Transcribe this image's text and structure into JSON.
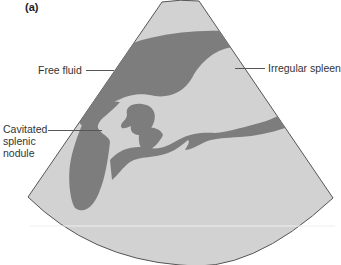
{
  "figure": {
    "panel_label": "(a)",
    "type": "ultrasound-schematic",
    "colors": {
      "background": "#ffffff",
      "parenchyma": "#d2d2d2",
      "dark_region": "#7d7d7d",
      "outline": "#555555"
    },
    "annotations": [
      {
        "id": "free-fluid",
        "text": "Free fluid"
      },
      {
        "id": "irregular-spleen",
        "text": "Irregular spleen"
      },
      {
        "id": "cavitated-splenic-nodule",
        "lines": [
          "Cavitated",
          "splenic",
          "nodule"
        ]
      }
    ]
  }
}
